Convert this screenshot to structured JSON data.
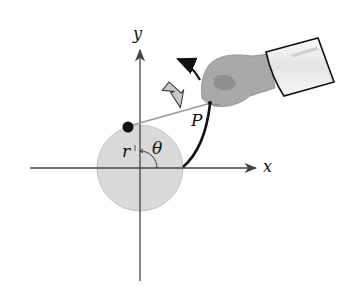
{
  "diagram": {
    "labels": {
      "y_axis": "y",
      "x_axis": "x",
      "point": "P",
      "radius": "r",
      "angle": "θ"
    },
    "colors": {
      "axis": "#444444",
      "circle_fill": "#d9d9d9",
      "circle_stroke": "#bdbdbd",
      "arc": "#111111",
      "string": "#9a9a9a",
      "mass": "#111111",
      "hollow_arrow_fill": "#c8c8c8",
      "hand": "#a9a9a9",
      "sleeve": "#f2f2f2"
    }
  }
}
